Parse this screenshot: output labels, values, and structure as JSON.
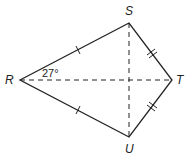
{
  "diagram": {
    "type": "kite",
    "vertices": {
      "R": {
        "label": "R",
        "x": 20,
        "y": 80
      },
      "S": {
        "label": "S",
        "x": 129,
        "y": 23
      },
      "T": {
        "label": "T",
        "x": 172,
        "y": 80
      },
      "U": {
        "label": "U",
        "x": 129,
        "y": 137
      }
    },
    "angle_label": "27°",
    "sides": [
      {
        "from": "R",
        "to": "S",
        "ticks": 1
      },
      {
        "from": "R",
        "to": "U",
        "ticks": 1
      },
      {
        "from": "S",
        "to": "T",
        "ticks": 2
      },
      {
        "from": "U",
        "to": "T",
        "ticks": 2
      }
    ],
    "diagonals": [
      {
        "from": "R",
        "to": "T",
        "style": "dashed"
      },
      {
        "from": "S",
        "to": "U",
        "style": "dashed"
      }
    ],
    "colors": {
      "stroke": "#222222",
      "background": "#ffffff"
    }
  }
}
